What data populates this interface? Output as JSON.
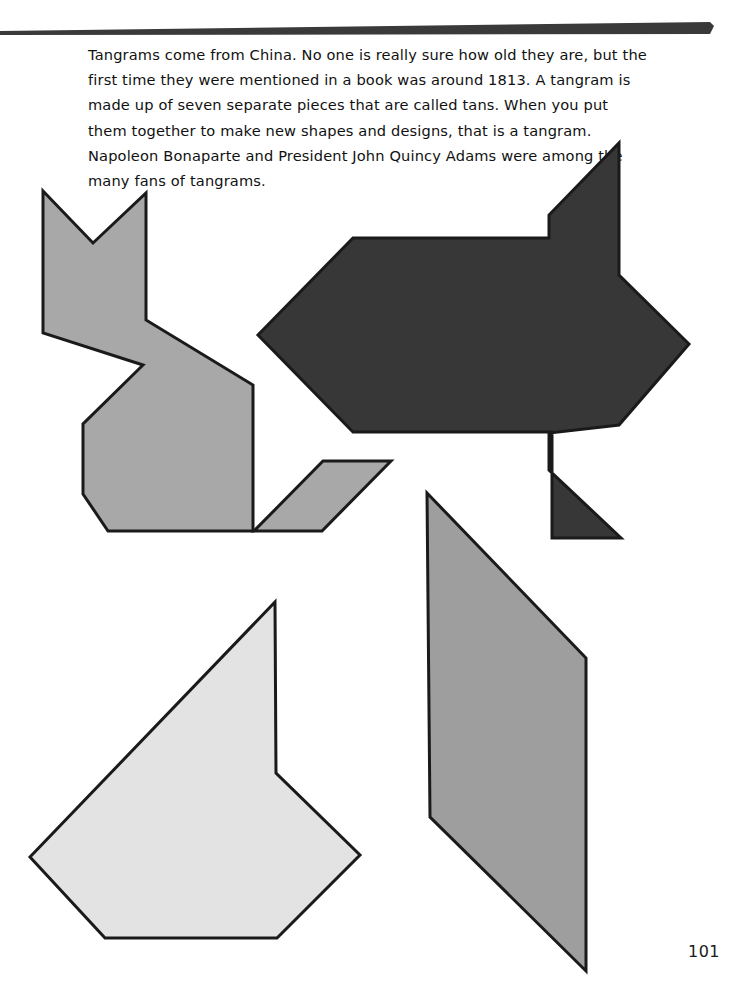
{
  "page": {
    "width": 743,
    "height": 1000,
    "background": "#ffffff",
    "page_number": "101",
    "rule_color": "#3a3a3a"
  },
  "passage": {
    "text": "Tangrams come from China. No one is really sure how old they are, but the first time they were mentioned in a book was around 1813. A tangram is made up of seven separate pieces that are called tans. When you put them together to make new shapes and designs, that is a tangram. Napoleon Bonaparte and President John Quincy Adams were among the many fans of tangrams.",
    "lines": [
      "Tangrams come from China. No one is really sure how old they are,",
      "but the first time they were mentioned in a book was around 1813. A",
      "tangram is made up of seven separate pieces that are called tans.",
      "When you put them together to make new shapes and designs, that is",
      "a tangram. Napoleon Bonaparte and President John Quincy Adams",
      "were among the many fans of tangrams."
    ]
  },
  "colors": {
    "outline": "#1a1a1a",
    "medium_gray": "#a8a8a8",
    "dark_charcoal": "#373737",
    "light_gray": "#e3e3e3",
    "mid_gray": "#9e9e9e"
  },
  "shapes": [
    {
      "id": "cat-figure",
      "name": "gray-cat-tangram-shape",
      "fill": "#a8a8a8",
      "stroke": "#1a1a1a",
      "stroke_width": 3,
      "points": "43,191 93,243 146,193 146,320 253,385 253,531 108,531 83,494 83,424 143,365 43,333"
    },
    {
      "id": "cat-tail",
      "name": "gray-parallelogram-tail-shape",
      "fill": "#a8a8a8",
      "stroke": "#1a1a1a",
      "stroke_width": 3,
      "points": "254,531 323,461 391,461 322,531"
    },
    {
      "id": "arrow-figure",
      "name": "dark-arrow-tangram-shape",
      "fill": "#373737",
      "stroke": "#1a1a1a",
      "stroke_width": 3,
      "points": "353,238 549,238 549,215 619,143 619,275 689,344 619,425 549,433 549,470 621,538 552,538 552,432 353,432 258,335"
    },
    {
      "id": "light-pentagon",
      "name": "light-gray-pentagon-tangram-shape",
      "fill": "#e3e3e3",
      "stroke": "#1a1a1a",
      "stroke_width": 3,
      "points": "275,602 276,773 360,855 277,938 105,938 30,857"
    },
    {
      "id": "tall-parallelogram",
      "name": "gray-tall-parallelogram-tangram-shape",
      "fill": "#9e9e9e",
      "stroke": "#1a1a1a",
      "stroke_width": 3,
      "points": "427,493 586,658 586,971 430,817"
    }
  ]
}
